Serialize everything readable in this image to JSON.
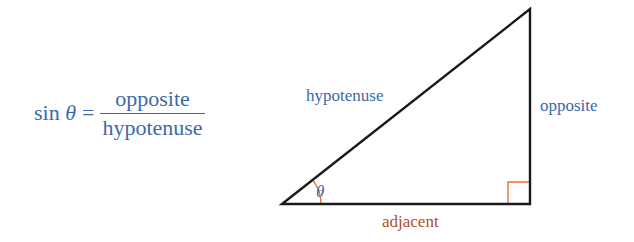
{
  "formula": {
    "lhs_func": "sin",
    "lhs_var": "θ",
    "equals": "=",
    "numerator": "opposite",
    "denominator": "hypotenuse"
  },
  "triangle": {
    "labels": {
      "hypotenuse": "hypotenuse",
      "opposite": "opposite",
      "adjacent": "adjacent",
      "angle": "θ"
    },
    "colors": {
      "edges": "#1a1a1a",
      "text_blue": "#3a6aab",
      "accent_orange": "#e8703a",
      "adjacent_label": "#b0502e"
    }
  }
}
